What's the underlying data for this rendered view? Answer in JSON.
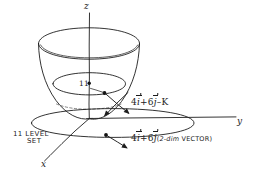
{
  "figure": {
    "background_color": "#ffffff",
    "ink_color": "#1d1d1d"
  },
  "axes": {
    "z_label": "z",
    "y_label": "y",
    "x_label": "x"
  },
  "level_set": {
    "value_label": "11",
    "caption_line_1": "11 LEVEL",
    "caption_line_2": "SET"
  },
  "annotations": {
    "vector_3d": {
      "coefficient_i": "4",
      "symbol_i": "i",
      "plus": "+",
      "coefficient_j": "6",
      "symbol_j": "j",
      "minus": "–",
      "symbol_k": "K"
    },
    "vector_2d": {
      "coefficient_i": "4",
      "symbol_i": "i",
      "plus": "+",
      "coefficient_j": "6",
      "symbol_j": "j",
      "note_open": "(",
      "note_dim": "2-dim",
      "note_word": "VECTOR",
      "note_close": ")"
    }
  }
}
